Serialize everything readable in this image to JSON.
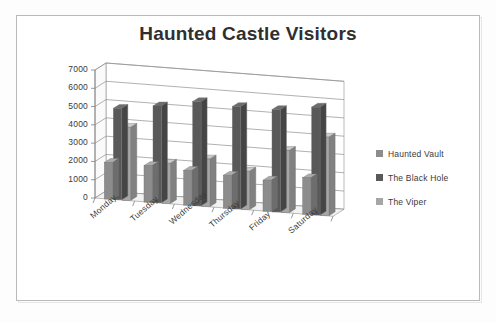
{
  "chart_data": {
    "type": "bar",
    "title": "Haunted Castle Visitors",
    "xlabel": "",
    "ylabel": "",
    "ylim": [
      0,
      7000
    ],
    "ytick_labels": [
      "7000",
      "6000",
      "5000",
      "4000",
      "3000",
      "2000",
      "1000",
      "0"
    ],
    "ytick_values": [
      7000,
      6000,
      5000,
      4000,
      3000,
      2000,
      1000,
      0
    ],
    "grid": true,
    "three_d": true,
    "legend_position": "right",
    "categories": [
      "Monday",
      "Tuesday",
      "Wednesday",
      "Thursday",
      "Friday",
      "Saturday"
    ],
    "series": [
      {
        "name": "Haunted Vault",
        "color": "#8c8c8c",
        "values": [
          2000,
          2000,
          1900,
          1800,
          1700,
          2000
        ]
      },
      {
        "name": "The Black Hole",
        "color": "#595959",
        "values": [
          5000,
          5300,
          5700,
          5600,
          5600,
          5900
        ]
      },
      {
        "name": "The Viper",
        "color": "#a6a6a6",
        "values": [
          4000,
          2200,
          2600,
          2100,
          3400,
          4300
        ]
      }
    ]
  },
  "legend": {
    "items": [
      {
        "label": "Haunted Vault",
        "color": "#8c8c8c"
      },
      {
        "label": "The Black Hole",
        "color": "#595959"
      },
      {
        "label": "The Viper",
        "color": "#a6a6a6"
      }
    ]
  },
  "colors": {
    "frame_border": "#b9b9b9",
    "axis_line": "#7f7f7f",
    "gridline": "#8f8f8f",
    "text": "#3a3a3a",
    "title": "#2f2f2f",
    "background": "#ffffff",
    "floor": "#f2f2f2"
  }
}
